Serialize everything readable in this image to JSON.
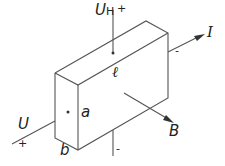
{
  "diagram": {
    "labels": {
      "hall_voltage": "U",
      "hall_subscript": "H",
      "hall_plus": "+",
      "hall_minus": "-",
      "current": "I",
      "current_minus": "-",
      "length": "ℓ",
      "height": "a",
      "thickness": "b",
      "field": "B",
      "voltage": "U",
      "voltage_plus": "+"
    },
    "colors": {
      "line": "#555555",
      "text": "#222222"
    }
  }
}
